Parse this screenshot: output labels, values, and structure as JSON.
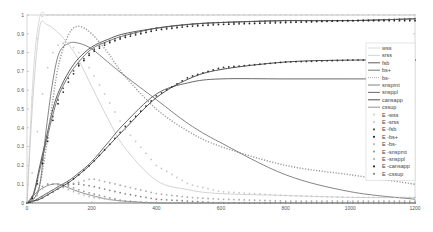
{
  "chart_data": {
    "type": "line",
    "title": "",
    "xlabel": "",
    "ylabel": "",
    "xlim": [
      0,
      1200
    ],
    "ylim": [
      0,
      1
    ],
    "grid": false,
    "legend_position": "right-center",
    "x_ticks": [
      "0",
      "200",
      "400",
      "600",
      "800",
      "1000",
      "1200"
    ],
    "y_ticks": [
      "0",
      "0.1",
      "0.2",
      "0.3",
      "0.4",
      "0.5",
      "0.6",
      "0.7",
      "0.8",
      "0.9",
      "1"
    ],
    "x": [
      0,
      20,
      40,
      60,
      80,
      100,
      130,
      160,
      200,
      250,
      300,
      400,
      500,
      600,
      800,
      1000,
      1200
    ],
    "series": [
      {
        "name": "wss",
        "style": "solid",
        "color": "#cfcfcf",
        "values": [
          0,
          0.7,
          0.99,
          1,
          1,
          1,
          1,
          1,
          1,
          1,
          1,
          1,
          1,
          1,
          1,
          1,
          1
        ]
      },
      {
        "name": "srss",
        "style": "solid",
        "color": "#c8c8c8",
        "values": [
          0,
          0.6,
          0.94,
          0.95,
          0.93,
          0.9,
          0.84,
          0.76,
          0.62,
          0.45,
          0.3,
          0.12,
          0.07,
          0.05,
          0.04,
          0.03,
          0.03
        ]
      },
      {
        "name": "fsb",
        "style": "solid",
        "color": "#333333",
        "values": [
          0,
          0.05,
          0.2,
          0.35,
          0.5,
          0.6,
          0.7,
          0.77,
          0.83,
          0.87,
          0.9,
          0.93,
          0.95,
          0.96,
          0.97,
          0.97,
          0.98
        ]
      },
      {
        "name": "bs+",
        "style": "solid",
        "color": "#555555",
        "values": [
          0,
          0.04,
          0.18,
          0.33,
          0.47,
          0.58,
          0.68,
          0.75,
          0.82,
          0.86,
          0.89,
          0.93,
          0.95,
          0.96,
          0.97,
          0.97,
          0.98
        ]
      },
      {
        "name": "bs-",
        "style": "dotted",
        "color": "#9a9a9a",
        "values": [
          0,
          0.02,
          0.1,
          0.3,
          0.55,
          0.75,
          0.9,
          0.94,
          0.9,
          0.8,
          0.68,
          0.5,
          0.38,
          0.3,
          0.2,
          0.15,
          0.1
        ]
      },
      {
        "name": "snspmt",
        "style": "solid",
        "color": "#666666",
        "values": [
          0,
          0.02,
          0.1,
          0.4,
          0.65,
          0.8,
          0.85,
          0.85,
          0.82,
          0.75,
          0.68,
          0.55,
          0.42,
          0.32,
          0.15,
          0.06,
          0.02
        ]
      },
      {
        "name": "snsppl",
        "style": "solid",
        "color": "#444444",
        "values": [
          0,
          0.01,
          0.03,
          0.05,
          0.07,
          0.09,
          0.12,
          0.16,
          0.22,
          0.32,
          0.42,
          0.58,
          0.64,
          0.66,
          0.66,
          0.66,
          0.66
        ]
      },
      {
        "name": "cansapp",
        "style": "solid",
        "color": "#222222",
        "values": [
          0,
          0.01,
          0.02,
          0.04,
          0.06,
          0.08,
          0.11,
          0.15,
          0.21,
          0.3,
          0.39,
          0.56,
          0.66,
          0.71,
          0.75,
          0.76,
          0.76
        ]
      },
      {
        "name": "cssup",
        "style": "solid",
        "color": "#777777",
        "values": [
          0,
          0.04,
          0.07,
          0.09,
          0.1,
          0.1,
          0.08,
          0.06,
          0.04,
          0.02,
          0.01,
          0,
          0,
          0,
          0,
          0,
          0
        ]
      },
      {
        "name": "E -wss",
        "style": "markers",
        "color": "#d0d0d0",
        "values": [
          0,
          0.7,
          0.99,
          1,
          1,
          1,
          1,
          1,
          1,
          1,
          1,
          1,
          1,
          1,
          1,
          1,
          1
        ]
      },
      {
        "name": "E -srss",
        "style": "markers",
        "color": "#c8c8c8",
        "values": [
          0,
          0.2,
          0.5,
          0.7,
          0.8,
          0.85,
          0.85,
          0.8,
          0.7,
          0.55,
          0.4,
          0.2,
          0.1,
          0.06,
          0.04,
          0.03,
          0.03
        ]
      },
      {
        "name": "E -fsb",
        "style": "markers",
        "color": "#555555",
        "values": [
          0,
          0.04,
          0.17,
          0.32,
          0.46,
          0.57,
          0.67,
          0.74,
          0.81,
          0.86,
          0.89,
          0.93,
          0.95,
          0.96,
          0.97,
          0.97,
          0.98
        ]
      },
      {
        "name": "E -bs+",
        "style": "markers",
        "color": "#222222",
        "values": [
          0,
          0.03,
          0.15,
          0.3,
          0.44,
          0.55,
          0.65,
          0.73,
          0.8,
          0.85,
          0.88,
          0.92,
          0.94,
          0.95,
          0.96,
          0.97,
          0.97
        ]
      },
      {
        "name": "E -bs-",
        "style": "markers",
        "color": "#bbbbbb",
        "values": [
          0,
          0.01,
          0.06,
          0.1,
          0.1,
          0.09,
          0.07,
          0.05,
          0.03,
          0.02,
          0.01,
          0,
          0,
          0,
          0,
          0,
          0
        ]
      },
      {
        "name": "E -snspmt",
        "style": "markers",
        "color": "#999999",
        "values": [
          0,
          0.02,
          0.08,
          0.1,
          0.1,
          0.1,
          0.09,
          0.07,
          0.05,
          0.03,
          0.01,
          0,
          0,
          0,
          0,
          0,
          0
        ]
      },
      {
        "name": "E -snsppl",
        "style": "markers",
        "color": "#aaaaaa",
        "values": [
          0,
          0.01,
          0.03,
          0.05,
          0.07,
          0.08,
          0.1,
          0.11,
          0.13,
          0.11,
          0.09,
          0.05,
          0.03,
          0.02,
          0.01,
          0.01,
          0.01
        ]
      },
      {
        "name": "E -cansapp",
        "style": "markers",
        "color": "#333333",
        "values": [
          0,
          0.01,
          0.02,
          0.04,
          0.06,
          0.08,
          0.11,
          0.15,
          0.21,
          0.3,
          0.4,
          0.57,
          0.67,
          0.72,
          0.75,
          0.76,
          0.76
        ]
      },
      {
        "name": "E -cssup",
        "style": "markers",
        "color": "#888888",
        "values": [
          0,
          0.01,
          0.02,
          0.04,
          0.06,
          0.08,
          0.1,
          0.1,
          0.09,
          0.07,
          0.05,
          0.02,
          0.01,
          0,
          0,
          0,
          0
        ]
      }
    ]
  },
  "legend": {
    "items": [
      "wss",
      "srss",
      "fsb",
      "bs+",
      "bs-",
      "snspmt",
      "snsppl",
      "cansapp",
      "cssup",
      "E -wss",
      "E -srss",
      "E -fsb",
      "E -bs+",
      "E -bs-",
      "E -snspmt",
      "E -snsppl",
      "E -cansapp",
      "E -cssup"
    ]
  }
}
